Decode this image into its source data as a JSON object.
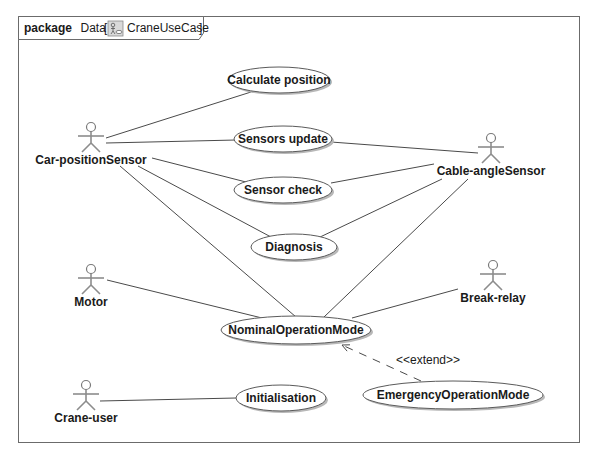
{
  "frame": {
    "keyword": "package",
    "package_name": "Data",
    "diagram_icon": "use-case-diagram-icon",
    "diagram_name": "CraneUseCase"
  },
  "actors": [
    {
      "id": "car-position-sensor",
      "label": "Car-positionSensor",
      "x": 91,
      "y": 127
    },
    {
      "id": "cable-angle-sensor",
      "label": "Cable-angleSensor",
      "x": 491,
      "y": 138
    },
    {
      "id": "motor",
      "label": "Motor",
      "x": 91,
      "y": 269
    },
    {
      "id": "break-relay",
      "label": "Break-relay",
      "x": 493,
      "y": 265
    },
    {
      "id": "crane-user",
      "label": "Crane-user",
      "x": 86,
      "y": 385
    }
  ],
  "use_cases": [
    {
      "id": "calculate-position",
      "label": "Calculate position",
      "cx": 279,
      "cy": 80,
      "rx": 51,
      "ry": 13
    },
    {
      "id": "sensors-update",
      "label": "Sensors update",
      "cx": 283,
      "cy": 139,
      "rx": 49,
      "ry": 13
    },
    {
      "id": "sensor-check",
      "label": "Sensor check",
      "cx": 283,
      "cy": 190,
      "rx": 49,
      "ry": 13
    },
    {
      "id": "diagnosis",
      "label": "Diagnosis",
      "cx": 294,
      "cy": 247,
      "rx": 43,
      "ry": 13
    },
    {
      "id": "nominal-operation-mode",
      "label": "NominalOperationMode",
      "cx": 296,
      "cy": 330,
      "rx": 75,
      "ry": 14
    },
    {
      "id": "initialisation",
      "label": "Initialisation",
      "cx": 281,
      "cy": 398,
      "rx": 45,
      "ry": 13
    },
    {
      "id": "emergency-operation-mode",
      "label": "EmergencyOperationMode",
      "cx": 453,
      "cy": 395,
      "rx": 90,
      "ry": 14
    }
  ],
  "associations": [
    {
      "from": "Car-positionSensor",
      "to": "Calculate position",
      "x1": 106,
      "y1": 138,
      "x2": 251,
      "y2": 92
    },
    {
      "from": "Car-positionSensor",
      "to": "Sensors update",
      "x1": 106,
      "y1": 143,
      "x2": 236,
      "y2": 140
    },
    {
      "from": "Car-positionSensor",
      "to": "Sensor check",
      "x1": 152,
      "y1": 158,
      "x2": 246,
      "y2": 182
    },
    {
      "from": "Car-positionSensor",
      "to": "Diagnosis",
      "x1": 138,
      "y1": 166,
      "x2": 271,
      "y2": 237
    },
    {
      "from": "Car-positionSensor",
      "to": "NominalOperationMode",
      "x1": 120,
      "y1": 166,
      "x2": 296,
      "y2": 317
    },
    {
      "from": "Cable-angleSensor",
      "to": "Sensors update",
      "x1": 478,
      "y1": 153,
      "x2": 331,
      "y2": 142
    },
    {
      "from": "Cable-angleSensor",
      "to": "Sensor check",
      "x1": 434,
      "y1": 164,
      "x2": 331,
      "y2": 183
    },
    {
      "from": "Cable-angleSensor",
      "to": "Diagnosis",
      "x1": 442,
      "y1": 179,
      "x2": 318,
      "y2": 238
    },
    {
      "from": "Cable-angleSensor",
      "to": "NominalOperationMode",
      "x1": 468,
      "y1": 179,
      "x2": 324,
      "y2": 317
    },
    {
      "from": "Motor",
      "to": "NominalOperationMode",
      "x1": 107,
      "y1": 280,
      "x2": 262,
      "y2": 318
    },
    {
      "from": "Break-relay",
      "to": "NominalOperationMode",
      "x1": 458,
      "y1": 289,
      "x2": 352,
      "y2": 318
    },
    {
      "from": "Crane-user",
      "to": "Initialisation",
      "x1": 100,
      "y1": 401,
      "x2": 236,
      "y2": 398
    }
  ],
  "extend": {
    "stereotype": "<<extend>>",
    "from": "EmergencyOperationMode",
    "to": "NominalOperationMode",
    "x1": 421,
    "y1": 381,
    "x2": 342,
    "y2": 345,
    "label_x": 396,
    "label_y": 364
  }
}
